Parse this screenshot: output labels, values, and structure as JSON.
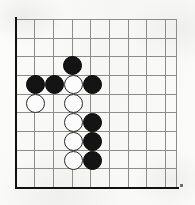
{
  "figure": {
    "kind": "go-board-diagram",
    "background_color": "#fbfbfa",
    "grid_line_color": "#8d8d8d",
    "board_edge_color": "#111111",
    "black_stone_color": "#141414",
    "white_stone_color": "#fcfcfc",
    "white_stone_outline_color": "#2b2b2b"
  },
  "board": {
    "origin_x": 16,
    "origin_y": 19,
    "cell_size_x": 18.6,
    "cell_size_y": 18.7,
    "columns": 9,
    "rows": 10,
    "stone_diameter": 19,
    "left_edge_x": 16,
    "bottom_edge_y": 187,
    "right_extent_x": 176,
    "top_extent_y": 19
  },
  "stones": [
    {
      "id": "b1",
      "color": "black",
      "col": 3,
      "row": 2,
      "cx": 72,
      "cy": 65
    },
    {
      "id": "b2",
      "color": "black",
      "col": 1,
      "row": 3,
      "cx": 35,
      "cy": 84
    },
    {
      "id": "b3",
      "color": "black",
      "col": 2,
      "row": 3,
      "cx": 54,
      "cy": 84
    },
    {
      "id": "b4",
      "color": "black",
      "col": 4,
      "row": 3,
      "cx": 92,
      "cy": 84
    },
    {
      "id": "w1",
      "color": "white",
      "col": 3,
      "row": 3,
      "cx": 73,
      "cy": 84
    },
    {
      "id": "w2",
      "color": "white",
      "col": 1,
      "row": 4,
      "cx": 35,
      "cy": 103
    },
    {
      "id": "w3",
      "color": "white",
      "col": 3,
      "row": 4,
      "cx": 73,
      "cy": 103
    },
    {
      "id": "w4",
      "color": "white",
      "col": 3,
      "row": 5,
      "cx": 73,
      "cy": 122
    },
    {
      "id": "b5",
      "color": "black",
      "col": 4,
      "row": 5,
      "cx": 92,
      "cy": 122
    },
    {
      "id": "w5",
      "color": "white",
      "col": 3,
      "row": 6,
      "cx": 73,
      "cy": 141
    },
    {
      "id": "b6",
      "color": "black",
      "col": 4,
      "row": 6,
      "cx": 92,
      "cy": 141
    },
    {
      "id": "w6",
      "color": "white",
      "col": 3,
      "row": 7,
      "cx": 73,
      "cy": 160
    },
    {
      "id": "b7",
      "color": "black",
      "col": 4,
      "row": 7,
      "cx": 92,
      "cy": 160
    }
  ],
  "grid_lines": {
    "vertical_x": [
      16,
      34,
      53,
      72,
      90,
      109,
      128,
      146,
      165,
      176
    ],
    "horizontal_y": [
      19,
      38,
      56,
      75,
      94,
      112,
      131,
      150,
      168,
      187
    ]
  },
  "corner_tick": {
    "x": 180,
    "y": 184,
    "width": 3,
    "height": 3
  }
}
